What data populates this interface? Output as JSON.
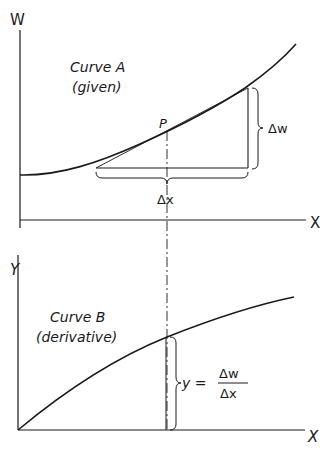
{
  "top_graph": {
    "y_axis_label": "W",
    "x_axis_label": "X",
    "curve_title": "Curve A",
    "curve_subtitle": "(given)",
    "point_label": "P",
    "delta_w_label": "Δw",
    "delta_x_label": "Δx"
  },
  "bottom_graph": {
    "y_axis_label": "Y",
    "x_axis_label": "X",
    "curve_title": "Curve B",
    "curve_subtitle": "(derivative)",
    "formula_lhs": "y =",
    "formula_numerator": "Δw",
    "formula_denominator": "Δx"
  },
  "colors": {
    "ink": "#1a1a1a",
    "background": "#ffffff"
  }
}
